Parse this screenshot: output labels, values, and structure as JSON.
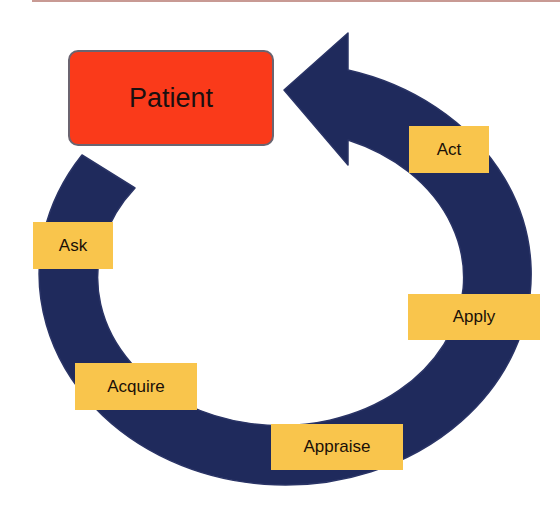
{
  "diagram": {
    "type": "cycle",
    "center_node": {
      "label": "Patient",
      "color": "#fa3a1a"
    },
    "arrow_color": "#1f2a5c",
    "step_color": "#f9c54c",
    "steps": [
      {
        "label": "Ask"
      },
      {
        "label": "Acquire"
      },
      {
        "label": "Appraise"
      },
      {
        "label": "Apply"
      },
      {
        "label": "Act"
      }
    ],
    "flow": "Ask → Acquire → Appraise → Apply → Act → Patient"
  }
}
